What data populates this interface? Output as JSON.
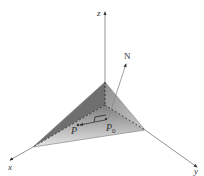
{
  "diagram": {
    "title": "",
    "axes": {
      "x_label": "x",
      "y_label": "y",
      "z_label": "z"
    },
    "normal_label": "N",
    "points": {
      "p_label": "P",
      "p0_label": "P",
      "p0_subscript": "0"
    },
    "colors": {
      "plane_light": "#d8d8d8",
      "plane_dark": "#8a8a8a",
      "axis": "#777777",
      "text": "#333333"
    }
  }
}
